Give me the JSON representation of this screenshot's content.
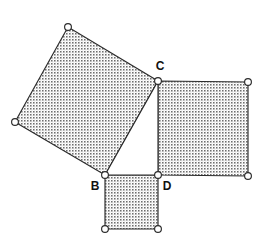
{
  "figure": {
    "background_color": "#ffffff",
    "stroke_color": "#2b2b2b",
    "fill_pattern_color": "#808080",
    "label_color": "#111111",
    "width": 261,
    "height": 233
  },
  "labels": {
    "b": "B",
    "c": "C",
    "d": "D"
  },
  "label_positions": {
    "b": {
      "x": 95,
      "y": 187
    },
    "c": {
      "x": 160,
      "y": 67
    },
    "d": {
      "x": 167,
      "y": 187
    }
  },
  "triangle": {
    "name": "right-triangle-BCD",
    "filled": false,
    "vertices": [
      {
        "id": "B",
        "x": 105,
        "y": 175
      },
      {
        "id": "C",
        "x": 158,
        "y": 81
      },
      {
        "id": "D",
        "x": 158,
        "y": 175
      }
    ],
    "points": "105,175 158,81 158,175"
  },
  "squares": [
    {
      "name": "square-on-hypotenuse-BC",
      "side_label": "BC",
      "filled": true,
      "points": "105,175 158,81 68,27 15,122",
      "vertices": [
        {
          "x": 105,
          "y": 175
        },
        {
          "x": 158,
          "y": 81
        },
        {
          "x": 68,
          "y": 27
        },
        {
          "x": 15,
          "y": 122
        }
      ]
    },
    {
      "name": "square-on-leg-CD",
      "side_label": "CD",
      "filled": true,
      "points": "158,81 248,82 248,176 158,175",
      "vertices": [
        {
          "x": 158,
          "y": 81
        },
        {
          "x": 248,
          "y": 82
        },
        {
          "x": 248,
          "y": 176
        },
        {
          "x": 158,
          "y": 175
        }
      ]
    },
    {
      "name": "square-on-leg-BD",
      "side_label": "BD",
      "filled": true,
      "points": "105,175 158,175 158,229 105,229",
      "vertices": [
        {
          "x": 105,
          "y": 175
        },
        {
          "x": 158,
          "y": 175
        },
        {
          "x": 158,
          "y": 229
        },
        {
          "x": 105,
          "y": 229
        }
      ]
    }
  ],
  "vertex_dots": [
    {
      "name": "vertex-dot-square-bc-top",
      "x": 68,
      "y": 27,
      "r": 3.4
    },
    {
      "name": "vertex-dot-square-bc-left",
      "x": 15,
      "y": 122,
      "r": 3.4
    },
    {
      "name": "vertex-dot-C",
      "x": 158,
      "y": 81,
      "r": 3.4
    },
    {
      "name": "vertex-dot-square-cd-top-right",
      "x": 248,
      "y": 82,
      "r": 3.4
    },
    {
      "name": "vertex-dot-square-cd-bottom-right",
      "x": 248,
      "y": 176,
      "r": 3.4
    },
    {
      "name": "vertex-dot-B",
      "x": 105,
      "y": 175,
      "r": 3.4
    },
    {
      "name": "vertex-dot-D",
      "x": 158,
      "y": 175,
      "r": 3.4
    },
    {
      "name": "vertex-dot-square-bd-bottom-left",
      "x": 105,
      "y": 229,
      "r": 3.4
    },
    {
      "name": "vertex-dot-square-bd-bottom-right",
      "x": 158,
      "y": 229,
      "r": 3.4
    }
  ]
}
